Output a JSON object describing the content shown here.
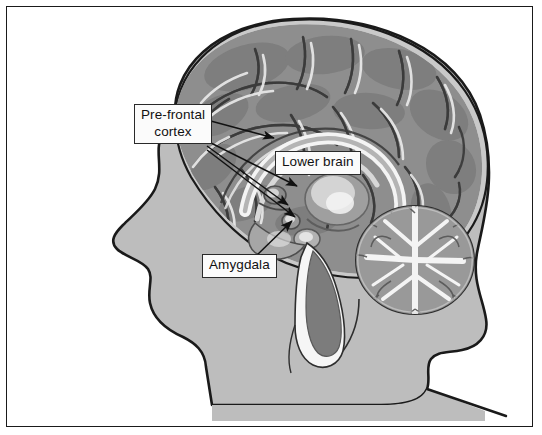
{
  "figure": {
    "border_color": "#1a1a1a",
    "background": "#ffffff"
  },
  "palette": {
    "skin_gray": "#bdbdbd",
    "cortex_gray": "#8e8e8e",
    "cortex_dark": "#6f6f6f",
    "meninges_light": "#c9c9c9",
    "highlight_white": "#f2f2f2",
    "outline_black": "#1a1a1a",
    "cerebellum_gray": "#9a9a9a",
    "brainstem_gray": "#7c7c7c",
    "callout_fill": "#fbfbfb",
    "callout_border": "#2a2a2a",
    "arrow_color": "#111111"
  },
  "labels": [
    {
      "id": "pre-frontal-cortex",
      "lines": [
        "Pre-frontal",
        "cortex"
      ],
      "line1": "Pre-frontal",
      "line2": "cortex",
      "box": {
        "x": 127,
        "y": 97,
        "w": 78
      },
      "arrow_count": 4
    },
    {
      "id": "lower-brain",
      "lines": [
        "Lower brain"
      ],
      "line1": "Lower brain",
      "box": {
        "x": 268,
        "y": 144
      },
      "arrow_count": 0
    },
    {
      "id": "amygdala",
      "lines": [
        "Amygdala"
      ],
      "line1": "Amygdala",
      "box": {
        "x": 195,
        "y": 247
      },
      "arrow_count": 1
    }
  ],
  "anatomy": {
    "regions": [
      "head-profile",
      "cerebral-cortex",
      "corpus-callosum",
      "thalamus",
      "cerebellum",
      "brainstem",
      "amygdala",
      "pre-frontal-cortex",
      "lower-brain"
    ]
  }
}
